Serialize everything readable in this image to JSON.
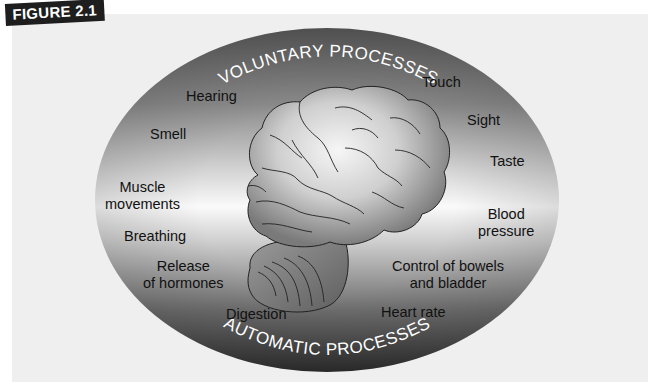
{
  "figure": {
    "tag": "FIGURE 2.1"
  },
  "diagram": {
    "arc_labels": {
      "top": "VOLUNTARY PROCESSES",
      "bottom": "AUTOMATIC PROCESSES"
    },
    "colors": {
      "panel": "#efefef",
      "ellipse_dark": "#4a4a4a",
      "ellipse_light": "#f4f4f4",
      "brain_fill": "#bdbdbd",
      "tag_bg": "#1e1e1e"
    },
    "labels": {
      "hearing": "Hearing",
      "smell": "Smell",
      "muscle_movements": [
        "Muscle",
        "movements"
      ],
      "breathing": "Breathing",
      "release_of_hormones": [
        "Release",
        "of hormones"
      ],
      "digestion": "Digestion",
      "touch": "Touch",
      "sight": "Sight",
      "taste": "Taste",
      "blood_pressure": [
        "Blood",
        "pressure"
      ],
      "control_bowels_bladder": [
        "Control of bowels",
        "and bladder"
      ],
      "heart_rate": "Heart rate"
    }
  }
}
